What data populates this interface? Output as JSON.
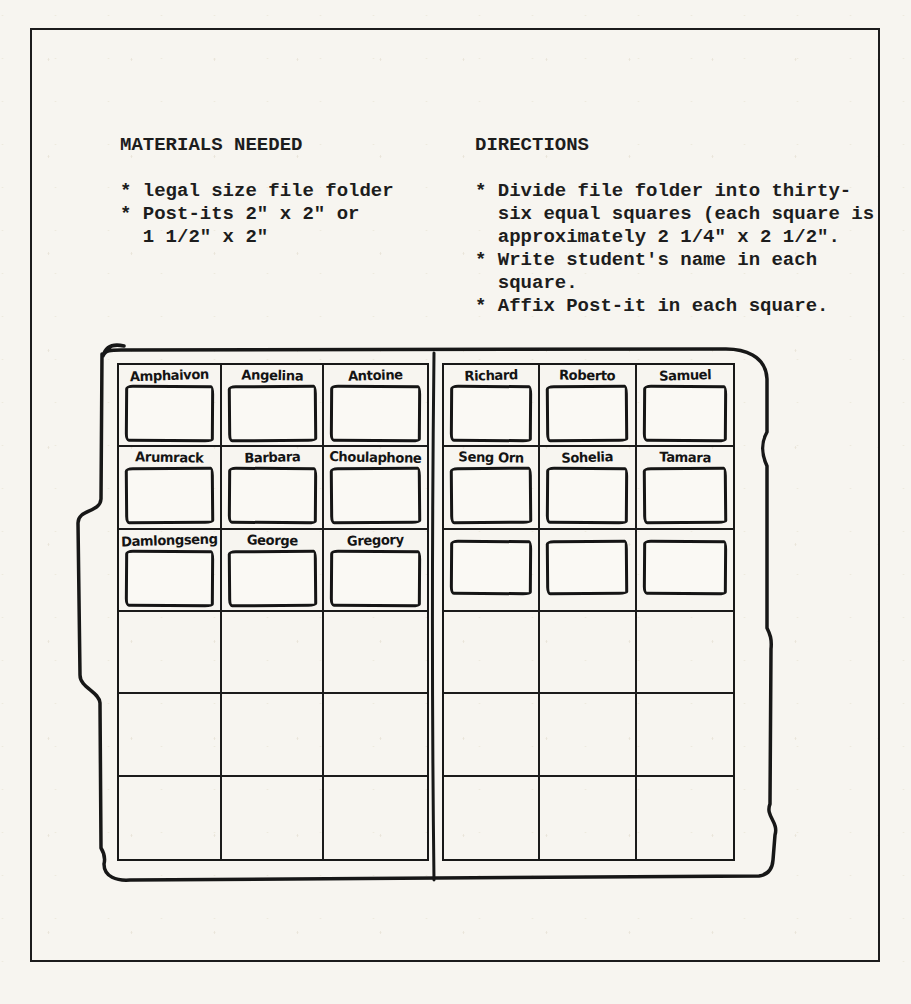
{
  "page": {
    "materials": {
      "heading": "MATERIALS NEEDED",
      "lines": [
        "* legal size file folder",
        "* Post-its 2\" x 2\" or",
        "  1 1/2\" x 2\""
      ]
    },
    "directions": {
      "heading": "DIRECTIONS",
      "lines": [
        "* Divide file folder into thirty-",
        "  six equal squares (each square is",
        "  approximately 2 1/4\" x 2 1/2\".",
        "* Write student's name in each",
        "  square.",
        "* Affix Post-it in each square."
      ]
    }
  },
  "folder": {
    "left_panel": {
      "columns": 3,
      "rows": 6,
      "postit_rows": [
        {
          "names": [
            "Amphaivon",
            "Angelina",
            "Antoine"
          ]
        },
        {
          "names": [
            "Arumrack",
            "Barbara",
            "Choulaphone"
          ]
        },
        {
          "names": [
            "Damlongseng",
            "George",
            "Gregory"
          ]
        }
      ]
    },
    "right_panel": {
      "columns": 3,
      "rows": 6,
      "postit_rows": [
        {
          "names": [
            "Richard",
            "Roberto",
            "Samuel"
          ]
        },
        {
          "names": [
            "Seng Orn",
            "Sohelia",
            "Tamara"
          ]
        },
        {
          "names": [
            null,
            null,
            null
          ]
        }
      ]
    }
  },
  "colors": {
    "paper": "#f7f5f0",
    "ink": "#1c1c1c"
  }
}
